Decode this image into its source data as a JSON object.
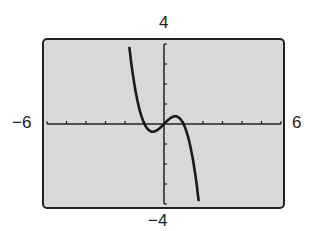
{
  "chart_data": {
    "type": "line",
    "title": "",
    "xlabel": "",
    "ylabel": "",
    "xlim": [
      -6,
      6
    ],
    "ylim": [
      -4,
      4
    ],
    "x_tick_step": 1,
    "y_tick_step": 1,
    "grid": false,
    "window_labels": {
      "xmin": "−6",
      "xmax": "6",
      "ymin": "−4",
      "ymax": "4"
    },
    "series": [
      {
        "name": "f(x)",
        "description": "cubic, decreasing overall, local min near (-0.58,-0.38), local max near (0.58,0.38)",
        "x": [
          -1.85,
          -1.5,
          -1.2,
          -1.0,
          -0.8,
          -0.58,
          -0.3,
          0,
          0.3,
          0.58,
          0.8,
          1.0,
          1.2,
          1.5,
          1.8
        ],
        "y": [
          4.48,
          1.88,
          0.53,
          0.0,
          -0.29,
          -0.38,
          -0.27,
          0,
          0.27,
          0.38,
          0.29,
          0.0,
          -0.53,
          -1.88,
          -4.03
        ]
      }
    ],
    "colors": {
      "background": "#d9d9d9",
      "curve": "#1a1a1a",
      "frame": "#222222"
    }
  }
}
